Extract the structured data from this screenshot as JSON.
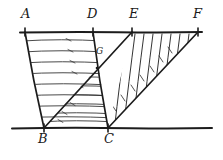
{
  "figure": {
    "kind": "diagram",
    "canvas": {
      "width": 223,
      "height": 160
    },
    "stroke_color": "#1c1c1c",
    "hatch_color": "#2b2b2b",
    "background_color": "#ffffff",
    "labels": [
      {
        "id": "A",
        "text": "A",
        "x": 21,
        "y": 7
      },
      {
        "id": "D",
        "text": "D",
        "x": 87,
        "y": 7
      },
      {
        "id": "E",
        "text": "E",
        "x": 129,
        "y": 7
      },
      {
        "id": "F",
        "text": "F",
        "x": 193,
        "y": 7
      },
      {
        "id": "B",
        "text": "B",
        "x": 38,
        "y": 133
      },
      {
        "id": "C",
        "text": "C",
        "x": 104,
        "y": 133
      },
      {
        "id": "G",
        "text": "G",
        "x": 96,
        "y": 47
      }
    ],
    "points": {
      "A": {
        "x": 25,
        "y": 32
      },
      "B": {
        "x": 44,
        "y": 128
      },
      "C": {
        "x": 108,
        "y": 128
      },
      "D": {
        "x": 93,
        "y": 32
      },
      "E": {
        "x": 132,
        "y": 32
      },
      "F": {
        "x": 198,
        "y": 32
      },
      "G": {
        "x": 97,
        "y": 68
      }
    },
    "segments": [
      {
        "name": "top-parallel-line",
        "from": [
          20,
          32
        ],
        "to": [
          202,
          32
        ]
      },
      {
        "name": "bottom-parallel-line",
        "from": [
          12,
          128
        ],
        "to": [
          212,
          128
        ]
      },
      {
        "name": "side-AB",
        "from": [
          25,
          32
        ],
        "to": [
          44,
          128
        ]
      },
      {
        "name": "side-DC",
        "from": [
          93,
          32
        ],
        "to": [
          108,
          128
        ]
      },
      {
        "name": "diagonal-BE",
        "from": [
          44,
          128
        ],
        "to": [
          132,
          32
        ]
      },
      {
        "name": "side-CF",
        "from": [
          108,
          128
        ],
        "to": [
          198,
          32
        ]
      }
    ],
    "regions": [
      {
        "name": "parallelogram-ABCD",
        "vertices": "A,B,C,D",
        "hatch": "horizontal"
      },
      {
        "name": "triangle-BCE",
        "vertices": "B,C,E",
        "hatch": "horizontal-lower"
      },
      {
        "name": "triangle-ECF",
        "vertices": "E,C,F",
        "hatch": "steep-diagonal"
      }
    ],
    "tick_marks": [
      {
        "name": "tick-A",
        "x": 25,
        "y": 32
      },
      {
        "name": "tick-D",
        "x": 93,
        "y": 32
      },
      {
        "name": "tick-E",
        "x": 132,
        "y": 32
      },
      {
        "name": "tick-F",
        "x": 198,
        "y": 32
      },
      {
        "name": "tick-B",
        "x": 44,
        "y": 128
      },
      {
        "name": "tick-C",
        "x": 108,
        "y": 128
      }
    ]
  }
}
